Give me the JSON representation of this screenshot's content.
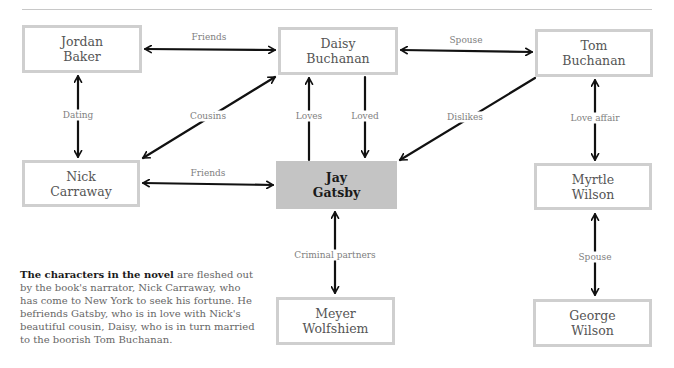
{
  "nodes": {
    "jordan": {
      "label": "Jordan\nBaker",
      "x": 22,
      "y": 25,
      "w": 120,
      "h": 48
    },
    "daisy": {
      "label": "Daisy\nBuchanan",
      "x": 278,
      "y": 27,
      "w": 120,
      "h": 48
    },
    "tom": {
      "label": "Tom\nBuchanan",
      "x": 535,
      "y": 29,
      "w": 118,
      "h": 48
    },
    "nick": {
      "label": "Nick\nCarraway",
      "x": 22,
      "y": 160,
      "w": 118,
      "h": 47
    },
    "jay": {
      "label": "Jay\nGatsby",
      "x": 276,
      "y": 161,
      "w": 121,
      "h": 48,
      "highlight": true
    },
    "myrtle": {
      "label": "Myrtle\nWilson",
      "x": 534,
      "y": 163,
      "w": 118,
      "h": 47
    },
    "meyer": {
      "label": "Meyer\nWolfshiem",
      "x": 276,
      "y": 297,
      "w": 119,
      "h": 48
    },
    "george": {
      "label": "George\nWilson",
      "x": 533,
      "y": 299,
      "w": 119,
      "h": 48
    }
  },
  "edges": [
    {
      "from": "jordan",
      "to": "daisy",
      "label": "Friends",
      "type": "both"
    },
    {
      "from": "daisy",
      "to": "tom",
      "label": "Spouse",
      "type": "both"
    },
    {
      "from": "jordan",
      "to": "nick",
      "label": "Dating",
      "type": "both"
    },
    {
      "from": "nick",
      "to": "daisy",
      "label": "Cousins",
      "type": "both"
    },
    {
      "from": "jay",
      "to": "daisy",
      "label": "Loves",
      "type": "one"
    },
    {
      "from": "daisy",
      "to": "jay",
      "label": "Loved",
      "type": "one"
    },
    {
      "from": "tom",
      "to": "jay",
      "label": "Dislikes",
      "type": "one"
    },
    {
      "from": "tom",
      "to": "myrtle",
      "label": "Love affair",
      "type": "both"
    },
    {
      "from": "nick",
      "to": "jay",
      "label": "Friends",
      "type": "both"
    },
    {
      "from": "jay",
      "to": "meyer",
      "label": "Criminal partners",
      "type": "both"
    },
    {
      "from": "myrtle",
      "to": "george",
      "label": "Spouse",
      "type": "both"
    }
  ],
  "edge_labels": {
    "friends_jd": "Friends",
    "spouse_dt": "Spouse",
    "dating": "Dating",
    "cousins": "Cousins",
    "loves": "Loves",
    "loved": "Loved",
    "dislikes": "Dislikes",
    "love_affair": "Love affair",
    "friends_nj": "Friends",
    "criminal": "Criminal partners",
    "spouse_mg": "Spouse"
  },
  "caption": {
    "bold": "The characters in the novel",
    "rest": " are fleshed out by the book's narrator, Nick Carraway, who has come to New York to seek his fortune. He befriends Gatsby, who is in love with Nick's beautiful cousin, Daisy, who is in turn married to the boorish Tom Buchanan."
  },
  "colors": {
    "box_border": "#cfcfcf",
    "highlight_fill": "#c4c4c4",
    "arrow": "#111111",
    "label_text": "#808080",
    "node_text": "#555555"
  }
}
